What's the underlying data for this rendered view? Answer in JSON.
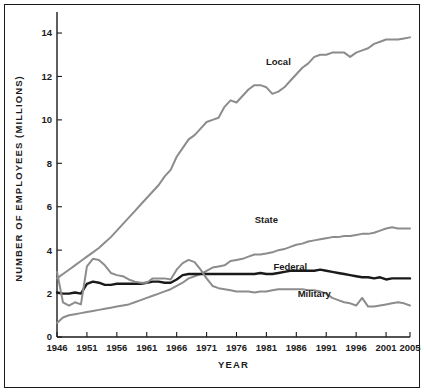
{
  "chart_data": {
    "type": "line",
    "title": "",
    "xlabel": "YEAR",
    "ylabel": "NUMBER OF EMPLOYEES (MILLIONS)",
    "xlim": [
      1946,
      2005
    ],
    "ylim": [
      0,
      14.6
    ],
    "grid": false,
    "legend_position": "inline-annotations",
    "xticks": [
      1946,
      1951,
      1956,
      1961,
      1966,
      1971,
      1976,
      1981,
      1986,
      1991,
      1996,
      2001,
      2005
    ],
    "xtick_labels": [
      "1946",
      "1951",
      "1956",
      "1961",
      "1966",
      "1971",
      "1976",
      "1981",
      "1986",
      "1991",
      "1996",
      "2001",
      "2005"
    ],
    "yticks": [
      0,
      2,
      4,
      6,
      8,
      10,
      12,
      14
    ],
    "ytick_labels": [
      "0",
      "2",
      "4",
      "6",
      "8",
      "10",
      "12",
      "14"
    ],
    "x": [
      1946,
      1947,
      1948,
      1949,
      1950,
      1951,
      1952,
      1953,
      1954,
      1955,
      1956,
      1957,
      1958,
      1959,
      1960,
      1961,
      1962,
      1963,
      1964,
      1965,
      1966,
      1967,
      1968,
      1969,
      1970,
      1971,
      1972,
      1973,
      1974,
      1975,
      1976,
      1977,
      1978,
      1979,
      1980,
      1981,
      1982,
      1983,
      1984,
      1985,
      1986,
      1987,
      1988,
      1989,
      1990,
      1991,
      1992,
      1993,
      1994,
      1995,
      1996,
      1997,
      1998,
      1999,
      2000,
      2001,
      2002,
      2003,
      2004,
      2005
    ],
    "series": [
      {
        "name": "Local",
        "color": "#8c8c8c",
        "label_x": 1983,
        "label_y": 12.55,
        "values": [
          2.7,
          2.9,
          3.1,
          3.3,
          3.5,
          3.7,
          3.9,
          4.1,
          4.35,
          4.6,
          4.9,
          5.2,
          5.5,
          5.8,
          6.1,
          6.4,
          6.7,
          7.0,
          7.4,
          7.7,
          8.3,
          8.7,
          9.1,
          9.3,
          9.6,
          9.9,
          10.0,
          10.1,
          10.6,
          10.9,
          10.8,
          11.1,
          11.4,
          11.6,
          11.6,
          11.5,
          11.2,
          11.3,
          11.5,
          11.8,
          12.1,
          12.4,
          12.6,
          12.9,
          13.0,
          13.0,
          13.1,
          13.1,
          13.1,
          12.9,
          13.1,
          13.2,
          13.3,
          13.5,
          13.6,
          13.7,
          13.7,
          13.7,
          13.75,
          13.8
        ]
      },
      {
        "name": "State",
        "color": "#8c8c8c",
        "label_x": 1981,
        "label_y": 5.25,
        "values": [
          0.65,
          0.9,
          1.0,
          1.05,
          1.1,
          1.15,
          1.2,
          1.25,
          1.3,
          1.35,
          1.4,
          1.45,
          1.5,
          1.6,
          1.7,
          1.8,
          1.9,
          2.0,
          2.1,
          2.2,
          2.35,
          2.5,
          2.7,
          2.8,
          2.9,
          3.05,
          3.2,
          3.25,
          3.3,
          3.5,
          3.55,
          3.6,
          3.7,
          3.8,
          3.8,
          3.85,
          3.9,
          4.0,
          4.05,
          4.15,
          4.25,
          4.3,
          4.4,
          4.45,
          4.5,
          4.55,
          4.6,
          4.6,
          4.65,
          4.65,
          4.7,
          4.75,
          4.75,
          4.8,
          4.9,
          5.0,
          5.05,
          5.0,
          5.0,
          5.0
        ]
      },
      {
        "name": "Federal",
        "color": "#1a1a1a",
        "label_x": 1985,
        "label_y": 3.1,
        "values": [
          2.05,
          2.0,
          2.0,
          2.05,
          2.0,
          2.45,
          2.55,
          2.5,
          2.4,
          2.4,
          2.45,
          2.45,
          2.45,
          2.45,
          2.45,
          2.5,
          2.55,
          2.55,
          2.5,
          2.5,
          2.65,
          2.85,
          2.9,
          2.9,
          2.9,
          2.9,
          2.9,
          2.9,
          2.9,
          2.9,
          2.9,
          2.9,
          2.9,
          2.9,
          2.95,
          2.9,
          2.9,
          2.95,
          3.0,
          3.05,
          3.05,
          3.05,
          3.05,
          3.05,
          3.1,
          3.05,
          3.0,
          2.95,
          2.9,
          2.85,
          2.8,
          2.75,
          2.75,
          2.7,
          2.75,
          2.65,
          2.7,
          2.7,
          2.7,
          2.7
        ]
      },
      {
        "name": "Military",
        "color": "#8c8c8c",
        "label_x": 1989,
        "label_y": 1.85,
        "values": [
          3.0,
          1.6,
          1.45,
          1.6,
          1.5,
          3.25,
          3.6,
          3.55,
          3.3,
          2.95,
          2.85,
          2.8,
          2.65,
          2.55,
          2.5,
          2.5,
          2.7,
          2.7,
          2.7,
          2.65,
          3.1,
          3.4,
          3.55,
          3.45,
          3.1,
          2.7,
          2.35,
          2.25,
          2.2,
          2.15,
          2.1,
          2.1,
          2.1,
          2.05,
          2.1,
          2.1,
          2.15,
          2.2,
          2.2,
          2.2,
          2.2,
          2.2,
          2.15,
          2.15,
          2.1,
          2.0,
          1.8,
          1.7,
          1.6,
          1.55,
          1.45,
          1.8,
          1.4,
          1.4,
          1.45,
          1.5,
          1.55,
          1.6,
          1.55,
          1.45
        ]
      }
    ]
  }
}
